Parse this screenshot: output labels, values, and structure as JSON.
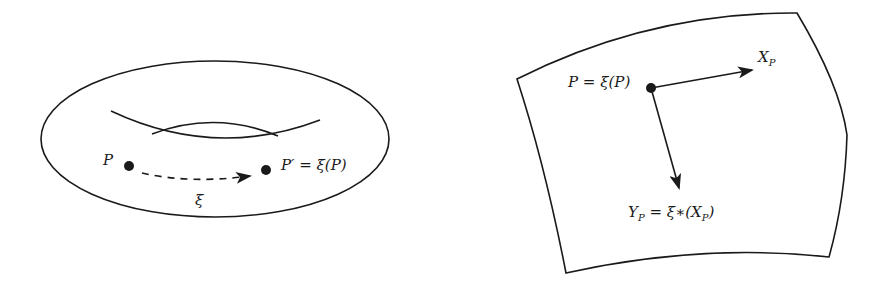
{
  "left_figure": {
    "name": "torus",
    "point_p_label": "P",
    "point_p_prime_label": "P′ = ξ(P)",
    "map_label": "ξ"
  },
  "right_figure": {
    "name": "surface-patch",
    "point_label": "P = ξ(P)",
    "vector_x_label": "X",
    "vector_x_sub": "P",
    "vector_y_label_main": "Y",
    "vector_y_sub": "P",
    "vector_y_rhs": " = ξ∗(X",
    "vector_y_rhs_sub": "P",
    "vector_y_close": ")"
  },
  "colors": {
    "stroke": "#1a1a1a",
    "background": "#ffffff"
  }
}
